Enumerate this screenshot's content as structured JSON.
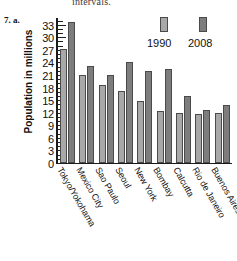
{
  "page": {
    "cut_off_text": "intervals.",
    "problem_number": "7. a."
  },
  "legend": {
    "series": [
      {
        "label": "1990",
        "color": "#a8a8a8"
      },
      {
        "label": "2008",
        "color": "#7d7d7d"
      }
    ]
  },
  "axis": {
    "y_title": "Population in millions",
    "y_ticks": [
      "0",
      "3",
      "6",
      "9",
      "12",
      "15",
      "18",
      "21",
      "24",
      "27",
      "30",
      "33"
    ]
  },
  "chart_data": {
    "type": "bar",
    "title": "",
    "xlabel": "",
    "ylabel": "Population in millions",
    "ylim": [
      0,
      34.5
    ],
    "ytick_step": 3,
    "minor_tick_step": 1,
    "grid": false,
    "legend_position": "top-right",
    "categories": [
      "Tokyo/Yokohama",
      "Mexico City",
      "Sao Paulo",
      "Seoul",
      "New York",
      "Bombay",
      "Calcutta",
      "Rio de Janeiro",
      "Buenos Aires"
    ],
    "series": [
      {
        "name": "1990",
        "color": "#a8a8a8",
        "values": [
          27,
          21,
          18.5,
          17,
          14.8,
          12.3,
          11.9,
          11.7,
          11.8
        ]
      },
      {
        "name": "2008",
        "color": "#7d7d7d",
        "values": [
          33.5,
          23,
          21,
          24,
          21.8,
          22.3,
          16,
          12.5,
          13.8
        ]
      }
    ]
  }
}
